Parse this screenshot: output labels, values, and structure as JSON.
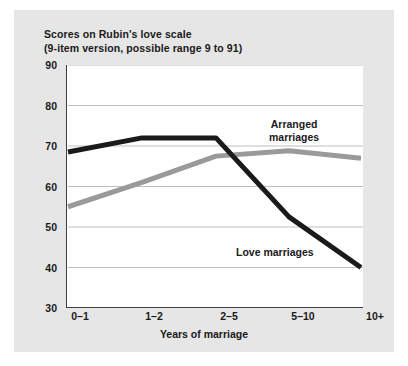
{
  "figure": {
    "background_color": "#e6e6e6",
    "plot_background_color": "#ffffff",
    "axis_color": "#3d3d3d",
    "grid_color": "#bfbfbf"
  },
  "chart_data": {
    "type": "line",
    "title": "Scores on Rubin's love scale",
    "subtitle": "(9-item version, possible range 9 to 91)",
    "xlabel": "Years of marriage",
    "ylabel": "",
    "categories": [
      "0–1",
      "1–2",
      "2–5",
      "5–10",
      "10+"
    ],
    "ylim": [
      30,
      90
    ],
    "yticks": [
      30,
      40,
      50,
      60,
      70,
      80,
      90
    ],
    "grid": true,
    "legend": "annotations-on-plot",
    "series": [
      {
        "name": "Love marriages",
        "color": "#1a1a1a",
        "values": [
          68.5,
          72,
          72,
          52.5,
          40
        ],
        "annotation": "Love marriages"
      },
      {
        "name": "Arranged marriages",
        "color": "#9a9a9a",
        "values": [
          55,
          61,
          67.5,
          68.8,
          67
        ],
        "annotation": "Arranged marriages"
      }
    ],
    "annotations": [
      {
        "text_line1": "Arranged",
        "text_line2": "marriages"
      },
      {
        "text_line1": "Love marriages",
        "text_line2": ""
      }
    ]
  }
}
